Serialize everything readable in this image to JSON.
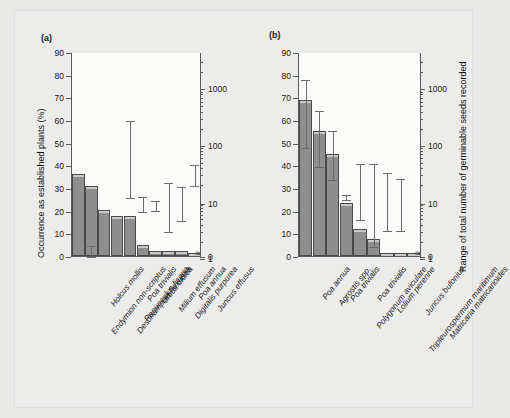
{
  "figure": {
    "background": "#ececeb",
    "bar_color": "#8e8e8e",
    "line_color": "#5a5a5a"
  },
  "panels": [
    {
      "tag": "(a)"
    },
    {
      "tag": "(b)"
    }
  ],
  "axes": {
    "left_title": "Occurrence as established plants (%)",
    "right_title": "Range of total number of germinable seeds recorded",
    "left_ticks": [
      "0",
      "10",
      "20",
      "30",
      "40",
      "50",
      "60",
      "70",
      "80",
      "90"
    ],
    "right_ticks": [
      "0",
      "1",
      "10",
      "100",
      "1000"
    ],
    "left_range": [
      0,
      90
    ],
    "right_range_log": [
      1,
      3000
    ]
  },
  "chart_data": [
    {
      "type": "bar",
      "title": "(a)",
      "xlabel": "",
      "ylabel": "Occurrence as established plants (%)",
      "y2label": "Range of total number of germinable seeds recorded",
      "ylim": [
        0,
        90
      ],
      "y2lim": [
        1,
        3000
      ],
      "y2scale": "log",
      "grid": false,
      "legend": "none",
      "categories": [
        "Endymion non-scriptus",
        "Holcus mollis",
        "Deschampsia flexuosa",
        "Ranunculus ficaria",
        "Poa trivialis",
        "Urtica dioica",
        "Milium effusum",
        "Digitalis purpurea",
        "Poa annua",
        "Juncus effusus"
      ],
      "values": [
        36,
        31,
        20.5,
        17.5,
        17.5,
        5,
        2,
        2,
        2,
        1.5
      ],
      "series": [
        {
          "name": "Occurrence as established plants (%)",
          "values": [
            36,
            31,
            20.5,
            17.5,
            17.5,
            5,
            2,
            2,
            2,
            1.5
          ]
        }
      ],
      "error_bars": {
        "axis": "right",
        "note": "Vertical range bars plotted against the right-hand logarithmic seed-number axis",
        "ranges_percent_scale": [
          null,
          [
            0,
            5
          ],
          null,
          null,
          [
            26,
            60
          ],
          [
            20,
            26.5
          ],
          [
            20.5,
            24.5
          ],
          [
            11,
            32.5
          ],
          [
            16,
            31
          ],
          [
            31.5,
            40.5
          ]
        ],
        "ranges_seed_counts": [
          null,
          [
            1,
            1.5
          ],
          null,
          null,
          [
            7,
            250
          ],
          [
            4,
            7.5
          ],
          [
            4.5,
            6
          ],
          [
            1.7,
            17
          ],
          [
            2.6,
            14
          ],
          [
            14,
            32
          ]
        ]
      }
    },
    {
      "type": "bar",
      "title": "(b)",
      "xlabel": "",
      "ylabel": "Occurrence as established plants (%)",
      "y2label": "Range of total number of germinable seeds recorded",
      "ylim": [
        0,
        90
      ],
      "y2lim": [
        1,
        3000
      ],
      "y2scale": "log",
      "grid": false,
      "legend": "none",
      "categories": [
        "Poa annua",
        "Agrostis spp.",
        "Poa trivialis",
        "Polygonum aviculare",
        "Poa trivialis",
        "Lolium perenne",
        "Tripleurospermum maritimum",
        "Juncus bufonius",
        "Matricaria matricarioides"
      ],
      "values": [
        69,
        55,
        45,
        23.5,
        12,
        7.5,
        1.5,
        1.5,
        1.5
      ],
      "series": [
        {
          "name": "Occurrence as established plants (%)",
          "values": [
            69,
            55,
            45,
            23.5,
            12,
            7.5,
            1.5,
            1.5,
            1.5
          ]
        }
      ],
      "error_bars": {
        "axis": "right",
        "note": "Vertical range bars plotted against the right-hand logarithmic seed-number axis",
        "ranges_percent_scale": [
          [
            48,
            78
          ],
          [
            39.5,
            64.5
          ],
          [
            34,
            55.5
          ],
          [
            25,
            27.5
          ],
          [
            16.5,
            41
          ],
          [
            4.5,
            41
          ],
          [
            11.5,
            37
          ],
          [
            11.5,
            34.5
          ],
          null
        ],
        "ranges_seed_counts": [
          [
            55,
            900
          ],
          [
            26,
            210
          ],
          [
            15,
            110
          ],
          [
            6.5,
            8
          ],
          [
            2.6,
            32
          ],
          [
            1.1,
            32
          ],
          [
            1.7,
            22
          ],
          [
            1.7,
            17
          ],
          null
        ]
      }
    }
  ]
}
